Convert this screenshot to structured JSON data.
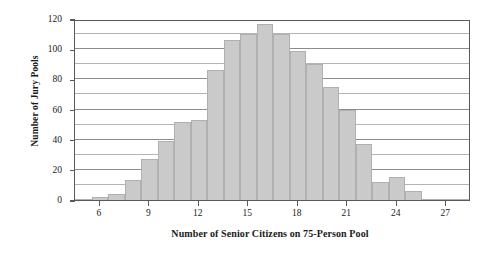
{
  "chart_data": {
    "type": "bar",
    "title": "",
    "xlabel": "Number of Senior Citizens on 75-Person Pool",
    "ylabel": "Number of Jury Pools",
    "categories": [
      5,
      6,
      7,
      8,
      9,
      10,
      11,
      12,
      13,
      14,
      15,
      16,
      17,
      18,
      19,
      20,
      21,
      22,
      23,
      24,
      25,
      26,
      27,
      28
    ],
    "values": [
      1,
      2,
      4,
      13,
      27,
      39,
      52,
      53,
      86,
      106,
      110,
      117,
      110,
      99,
      90,
      75,
      60,
      37,
      12,
      15,
      6,
      1,
      1,
      1
    ],
    "xlim": [
      4.5,
      28.5
    ],
    "ylim": [
      0,
      120
    ],
    "xticks": [
      6,
      9,
      12,
      15,
      18,
      21,
      24,
      27
    ],
    "yticks_major": [
      0,
      20,
      40,
      60,
      80,
      100,
      120
    ],
    "yticks_minor": [
      10,
      30,
      50,
      70,
      90,
      110
    ],
    "grid": "horizontal",
    "legend": "none",
    "bar_color": "#cacaca",
    "bar_edge_color": "#b0b0b0",
    "axis_color": "#5a5a5a",
    "grid_color": "#b4b4b4",
    "bar_width": 1
  }
}
